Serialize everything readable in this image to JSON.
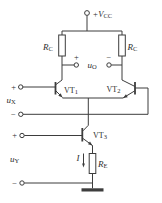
{
  "figure": {
    "type": "circuit-diagram",
    "background_color": "#ffffff",
    "line_color": "#3d3d3d",
    "text_color": "#2e2e2e"
  },
  "labels": {
    "vcc": {
      "base": "+V",
      "sub": "CC"
    },
    "rc_left": {
      "base": "R",
      "sub": "C"
    },
    "rc_right": {
      "base": "R",
      "sub": "C"
    },
    "re": {
      "base": "R",
      "sub": "E"
    },
    "vt1": {
      "base": "VT",
      "sub": "1"
    },
    "vt2": {
      "base": "VT",
      "sub": "2"
    },
    "vt3": {
      "base": "VT",
      "sub": "3"
    },
    "u_out": {
      "base": "u",
      "sub": "O"
    },
    "u_x": {
      "base": "u",
      "sub": "X"
    },
    "u_y": {
      "base": "u",
      "sub": "Y"
    },
    "current": "I",
    "out_plus": "+",
    "out_minus": "−",
    "ux_plus": "+",
    "ux_minus": "−",
    "uy_plus": "+",
    "uy_minus": "−"
  }
}
